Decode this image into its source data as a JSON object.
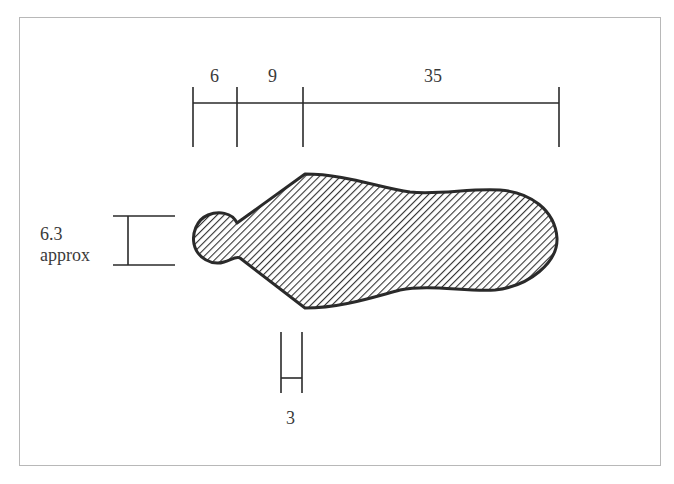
{
  "figure": {
    "type": "technical dimension drawing",
    "colors": {
      "line": "#2a2a2a",
      "hatch": "#333333",
      "frame": "#b8b8b8",
      "text": "#3a3a3a"
    }
  },
  "dimensions": {
    "top": [
      {
        "label": "6",
        "value": 6
      },
      {
        "label": "9",
        "value": 9
      },
      {
        "label": "35",
        "value": 35
      }
    ],
    "left": {
      "value_label": "6.3",
      "note_label": "approx"
    },
    "bottom": {
      "label": "3",
      "value": 3
    }
  }
}
